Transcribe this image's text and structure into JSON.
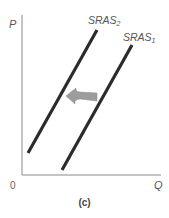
{
  "diagram": {
    "type": "economics-supply-shift",
    "axes": {
      "y_label": "P",
      "x_label": "Q",
      "origin_label": "0"
    },
    "curves": [
      {
        "name": "SRAS",
        "subscript": "2",
        "position": "left"
      },
      {
        "name": "SRAS",
        "subscript": "1",
        "position": "right"
      }
    ],
    "shift_arrow": {
      "direction": "left",
      "meaning": "SRAS1 shifts to SRAS2"
    },
    "caption": "(c)",
    "colors": {
      "curve": "#2b2b2b",
      "axis": "#8a8a8a",
      "arrow": "#9a9a9a",
      "text": "#555555"
    }
  }
}
